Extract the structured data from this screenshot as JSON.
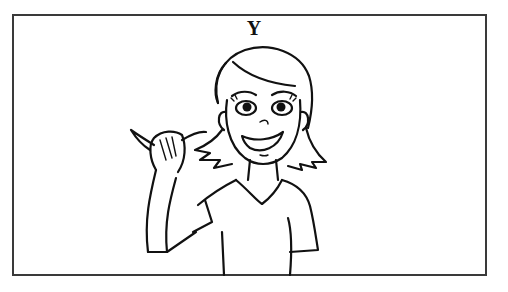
{
  "card": {
    "letter": "Y",
    "illustration": "woman-signing-letter-y",
    "border_color": "#3a3a3a"
  }
}
